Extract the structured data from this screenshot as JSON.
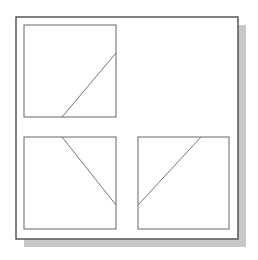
{
  "colors": {
    "background": "#ffffff",
    "frame": "#555555",
    "box": "#666666",
    "line": "#777777",
    "shadow": "#c8c8c8"
  },
  "frame": {
    "x": 16,
    "y": 17,
    "w": 222,
    "h": 222,
    "shadow_offset": 8
  },
  "panels": [
    {
      "name": "top-left",
      "x": 24,
      "y": 25,
      "w": 92,
      "h": 92,
      "line": [
        62,
        117,
        116,
        53
      ]
    },
    {
      "name": "bottom-left",
      "x": 24,
      "y": 137,
      "w": 92,
      "h": 92,
      "line": [
        62,
        137,
        116,
        205
      ]
    },
    {
      "name": "bottom-right",
      "x": 138,
      "y": 137,
      "w": 91,
      "h": 92,
      "line": [
        201,
        137,
        138,
        205
      ]
    }
  ]
}
